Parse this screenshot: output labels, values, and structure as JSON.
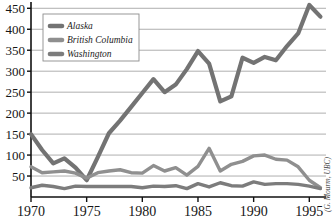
{
  "chart_data": {
    "type": "line",
    "title": "",
    "xlabel": "",
    "ylabel": "",
    "xlim": [
      1970,
      1996.5
    ],
    "ylim": [
      0,
      465
    ],
    "yticks": [
      50,
      100,
      150,
      200,
      250,
      300,
      350,
      400,
      450
    ],
    "xticks": [
      1970,
      1975,
      1980,
      1985,
      1990,
      1995
    ],
    "grid": "horizontal",
    "legend_position": "top-left",
    "annotation": "(G. Mourm, UBC)",
    "x": [
      1970,
      1971,
      1972,
      1973,
      1974,
      1975,
      1976,
      1977,
      1978,
      1979,
      1980,
      1981,
      1982,
      1983,
      1984,
      1985,
      1986,
      1987,
      1988,
      1989,
      1990,
      1991,
      1992,
      1993,
      1994,
      1995,
      1996
    ],
    "series": [
      {
        "name": "Alaska",
        "color": "#737373",
        "values": [
          150,
          112,
          80,
          92,
          70,
          40,
          95,
          152,
          182,
          215,
          248,
          281,
          250,
          268,
          305,
          348,
          318,
          228,
          240,
          332,
          320,
          334,
          326,
          360,
          390,
          458,
          430
        ]
      },
      {
        "name": "British Columbia",
        "color": "#8f8f8f",
        "values": [
          72,
          58,
          60,
          62,
          57,
          45,
          58,
          62,
          65,
          58,
          57,
          75,
          62,
          70,
          52,
          73,
          116,
          62,
          78,
          85,
          98,
          100,
          90,
          88,
          72,
          40,
          22
        ]
      },
      {
        "name": "Washington",
        "color": "#7c7c7c",
        "values": [
          22,
          28,
          25,
          20,
          26,
          25,
          25,
          25,
          25,
          25,
          22,
          26,
          25,
          27,
          20,
          32,
          24,
          34,
          27,
          26,
          36,
          30,
          32,
          32,
          30,
          26,
          20
        ]
      }
    ]
  },
  "legend": {
    "items": [
      {
        "label": "Alaska",
        "color": "#737373"
      },
      {
        "label": "British Columbia",
        "color": "#8f8f8f"
      },
      {
        "label": "Washington",
        "color": "#7c7c7c"
      }
    ]
  },
  "credit": {
    "text": "(G. Mourm, UBC)"
  }
}
